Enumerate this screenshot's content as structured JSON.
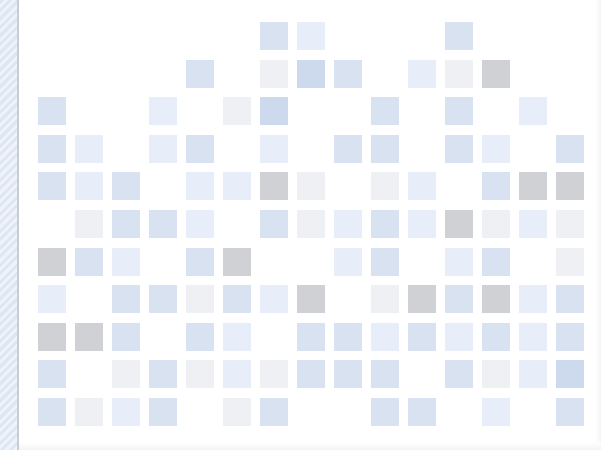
{
  "canvas": {
    "width": 601,
    "height": 450,
    "background": "#ffffff"
  },
  "left_bar": {
    "pattern": "diagonal-stripes",
    "colors": [
      "#dde6f2",
      "#eef3f9"
    ],
    "border": "#c8cdd4"
  },
  "grid": {
    "columns": 15,
    "rows": 11,
    "origin_x": 38,
    "origin_y": 22,
    "step_x": 37,
    "step_y": 37.6,
    "cell_size": 28,
    "palette": {
      "B": "#d8e2f1",
      "D": "#cdd9ec",
      "L": "#e7eef9",
      "W": "#eef0f3",
      "G": "#cfd1d4"
    },
    "cells": [
      "......BL...B...",
      "....B.WDB.LWG..",
      "B..L.WD..B.B.L.",
      "BL.LB.L.BB.BL.B",
      "BLB.LLGW.WL.BGG",
      ".WBBL.BWLBLGWLW",
      "GBL.BG..LB.LB.W",
      "L.BBWBLG.WGBGLB",
      "GGB.BL.BBLBLBLB",
      "B.WBWLWBBB.BWLD",
      "BWLB.WB..BB.L.B"
    ]
  }
}
